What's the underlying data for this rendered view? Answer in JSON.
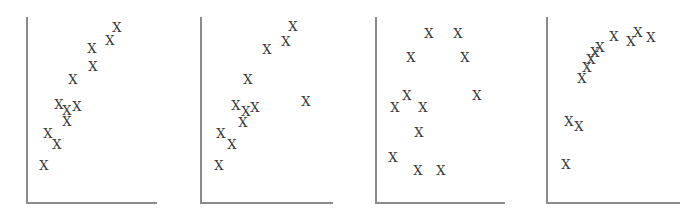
{
  "chart_data": [
    {
      "type": "scatter",
      "title": "",
      "xlabel": "",
      "ylabel": "",
      "grid": false,
      "legend": "none",
      "marker": "X",
      "description": "Roughly linear positive relationship with moderate scatter",
      "frame": {
        "axis_left_px": 26,
        "axis_bottom_px": 202,
        "axis_top_px": 17,
        "axis_right_px": 157
      },
      "points_px": [
        [
          44,
          165
        ],
        [
          48,
          133
        ],
        [
          57,
          144
        ],
        [
          59,
          104
        ],
        [
          67,
          110
        ],
        [
          77,
          106
        ],
        [
          67,
          121
        ],
        [
          73,
          79
        ],
        [
          93,
          66
        ],
        [
          92,
          48
        ],
        [
          110,
          40
        ],
        [
          117,
          27
        ]
      ]
    },
    {
      "type": "scatter",
      "title": "",
      "xlabel": "",
      "ylabel": "",
      "grid": false,
      "legend": "none",
      "marker": "X",
      "description": "Linear positive relationship with one outlier to the right",
      "frame": {
        "axis_left_px": 200,
        "axis_bottom_px": 202,
        "axis_top_px": 17,
        "axis_right_px": 333
      },
      "points_px": [
        [
          219,
          165
        ],
        [
          221,
          133
        ],
        [
          232,
          144
        ],
        [
          236,
          105
        ],
        [
          246,
          111
        ],
        [
          255,
          107
        ],
        [
          243,
          122
        ],
        [
          248,
          79
        ],
        [
          267,
          49
        ],
        [
          286,
          41
        ],
        [
          293,
          26
        ],
        [
          306,
          101
        ]
      ]
    },
    {
      "type": "scatter",
      "title": "",
      "xlabel": "",
      "ylabel": "",
      "grid": false,
      "legend": "none",
      "marker": "X",
      "description": "Dispersed points with no clear linear relationship",
      "frame": {
        "axis_left_px": 375,
        "axis_bottom_px": 202,
        "axis_top_px": 17,
        "axis_right_px": 505
      },
      "points_px": [
        [
          429,
          33
        ],
        [
          458,
          33
        ],
        [
          411,
          57
        ],
        [
          465,
          57
        ],
        [
          407,
          95
        ],
        [
          477,
          95
        ],
        [
          395,
          107
        ],
        [
          423,
          107
        ],
        [
          419,
          132
        ],
        [
          393,
          157
        ],
        [
          418,
          170
        ],
        [
          441,
          170
        ]
      ]
    },
    {
      "type": "scatter",
      "title": "",
      "xlabel": "",
      "ylabel": "",
      "grid": false,
      "legend": "none",
      "marker": "X",
      "description": "Curvilinear (concave, saturating) relationship",
      "frame": {
        "axis_left_px": 546,
        "axis_bottom_px": 202,
        "axis_top_px": 17,
        "axis_right_px": 680
      },
      "points_px": [
        [
          566,
          164
        ],
        [
          569,
          121
        ],
        [
          579,
          126
        ],
        [
          582,
          78
        ],
        [
          587,
          67
        ],
        [
          591,
          59
        ],
        [
          595,
          52
        ],
        [
          600,
          47
        ],
        [
          614,
          36
        ],
        [
          631,
          41
        ],
        [
          638,
          32
        ],
        [
          651,
          37
        ]
      ]
    }
  ],
  "panels": [
    {
      "marker_label": "X"
    },
    {
      "marker_label": "X"
    },
    {
      "marker_label": "X"
    },
    {
      "marker_label": "X"
    }
  ],
  "colors": {
    "axis": "#8a8a8a",
    "marker": "#3a3a3a",
    "background": "#ffffff"
  }
}
